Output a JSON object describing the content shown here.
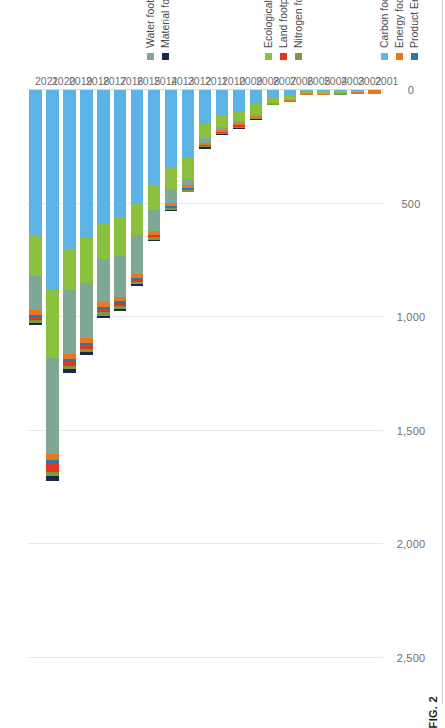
{
  "figure": {
    "caption": "FIG. 2",
    "orientation": "rotated-90-ccw"
  },
  "chart_data": {
    "type": "bar",
    "orientation": "horizontal-stacked",
    "title": "",
    "xlabel": "",
    "ylabel": "",
    "xlim": [
      0,
      2500
    ],
    "ticks": [
      "0",
      "500",
      "1,000",
      "1,500",
      "2,000",
      "2,500"
    ],
    "tick_values": [
      0,
      500,
      1000,
      1500,
      2000,
      2500
    ],
    "grid": true,
    "legend_position": "right",
    "categories": [
      "2001",
      "2002",
      "2003",
      "2004",
      "2005",
      "2006",
      "2007",
      "2008",
      "2009",
      "2010",
      "2011",
      "2012",
      "2013",
      "2014",
      "2015",
      "2016",
      "2017",
      "2018",
      "2019",
      "2020",
      "2021"
    ],
    "series": [
      {
        "name": "Carbon footprint",
        "color": "#5bb4e5",
        "values": [
          0,
          4,
          6,
          6,
          8,
          26,
          30,
          62,
          92,
          110,
          150,
          300,
          340,
          420,
          500,
          560,
          590,
          650,
          700,
          880,
          640
        ]
      },
      {
        "name": "Energy footprint",
        "color": "#ea7522",
        "values": [
          18,
          6,
          6,
          4,
          6,
          5,
          5,
          6,
          12,
          8,
          9,
          12,
          14,
          16,
          18,
          20,
          22,
          24,
          26,
          28,
          20
        ]
      },
      {
        "name": "Product Environmental Footprint",
        "color": "#2e75a8",
        "values": [
          0,
          0,
          0,
          0,
          0,
          0,
          0,
          0,
          0,
          2,
          3,
          3,
          4,
          5,
          6,
          7,
          8,
          9,
          10,
          12,
          8
        ]
      },
      {
        "name": "Ecological footprint",
        "color": "#8bc13f",
        "values": [
          0,
          5,
          6,
          10,
          6,
          18,
          26,
          50,
          46,
          52,
          62,
          90,
          96,
          110,
          140,
          170,
          155,
          200,
          180,
          300,
          180
        ]
      },
      {
        "name": "Land footprint",
        "color": "#e8341c",
        "values": [
          0,
          0,
          0,
          0,
          0,
          0,
          0,
          1,
          8,
          2,
          3,
          4,
          5,
          8,
          10,
          12,
          14,
          16,
          18,
          40,
          14
        ]
      },
      {
        "name": "Nitrogen footprint",
        "color": "#7a9a3b",
        "values": [
          0,
          2,
          2,
          2,
          2,
          3,
          3,
          5,
          5,
          6,
          6,
          8,
          9,
          10,
          12,
          14,
          14,
          16,
          16,
          18,
          12
        ]
      },
      {
        "name": "Water footprint",
        "color": "#7fa894",
        "values": [
          0,
          0,
          0,
          0,
          0,
          0,
          0,
          4,
          6,
          14,
          20,
          30,
          60,
          90,
          170,
          180,
          190,
          240,
          280,
          420,
          150
        ]
      },
      {
        "name": "Material footprint",
        "color": "#16284f",
        "values": [
          0,
          0,
          0,
          0,
          0,
          0,
          0,
          3,
          2,
          4,
          6,
          4,
          5,
          6,
          8,
          10,
          12,
          12,
          14,
          22,
          10
        ]
      }
    ],
    "stack_order": [
      "Material footprint",
      "Nitrogen footprint",
      "Land footprint",
      "Product Environmental Footprint",
      "Energy footprint",
      "Water footprint",
      "Ecological footprint",
      "Carbon footprint"
    ]
  },
  "legend_groups": [
    {
      "id": "group-top",
      "items": [
        {
          "label": "Water footprint",
          "color": "#7fa894"
        },
        {
          "label": "Material footprint",
          "color": "#16284f"
        }
      ]
    },
    {
      "id": "group-middle",
      "items": [
        {
          "label": "Ecological footprint",
          "color": "#8bc13f"
        },
        {
          "label": "Land footprint",
          "color": "#e8341c"
        },
        {
          "label": "Nitrogen footprint",
          "color": "#7a9a3b"
        }
      ]
    },
    {
      "id": "group-bottom",
      "items": [
        {
          "label": "Carbon footprint",
          "color": "#5bb4e5"
        },
        {
          "label": "Energy footprint",
          "color": "#ea7522"
        },
        {
          "label": "Product Environmental Footprint",
          "color": "#2e75a8"
        }
      ]
    }
  ]
}
